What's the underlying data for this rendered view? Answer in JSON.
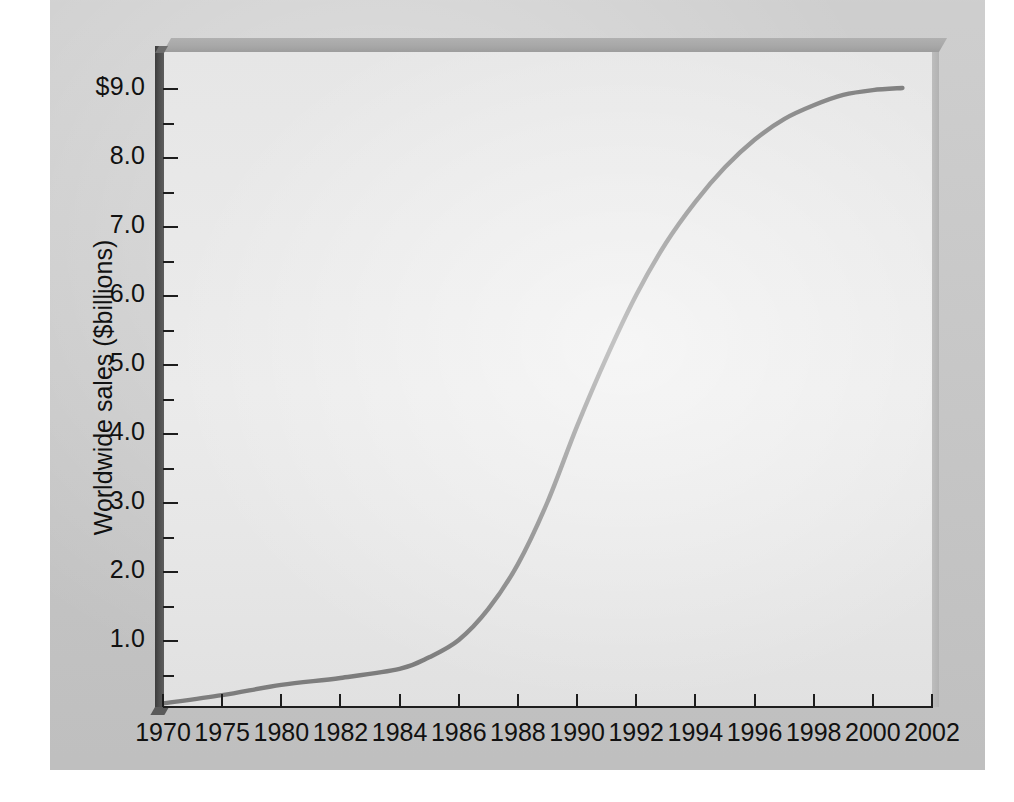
{
  "chart_data": {
    "type": "line",
    "title": "",
    "xlabel": "",
    "ylabel": "Worldwide sales ($billions)",
    "x_tick_labels": [
      "1970",
      "1975",
      "1980",
      "1982",
      "1984",
      "1986",
      "1988",
      "1990",
      "1992",
      "1994",
      "1996",
      "1998",
      "2000",
      "2002"
    ],
    "y_tick_labels": [
      "$9.0",
      "8.0",
      "7.0",
      "6.0",
      "5.0",
      "4.0",
      "3.0",
      "2.0",
      "1.0"
    ],
    "y_tick_values": [
      9.0,
      8.0,
      7.0,
      6.0,
      5.0,
      4.0,
      3.0,
      2.0,
      1.0
    ],
    "y_minor_tick_values": [
      8.5,
      7.5,
      6.5,
      5.5,
      4.5,
      3.5,
      2.5,
      1.5,
      0.5
    ],
    "ylim": [
      0.0,
      9.5
    ],
    "xlim": [
      1970,
      2002
    ],
    "grid": false,
    "legend": null,
    "series": [
      {
        "name": "Worldwide sales",
        "x": [
          1970,
          1975,
          1980,
          1982,
          1984,
          1985,
          1986,
          1987,
          1988,
          1989,
          1990,
          1991,
          1992,
          1993,
          1994,
          1995,
          1996,
          1997,
          1998,
          1999,
          2000,
          2001
        ],
        "values": [
          0.08,
          0.2,
          0.35,
          0.45,
          0.58,
          0.75,
          1.0,
          1.45,
          2.1,
          3.0,
          4.1,
          5.1,
          6.0,
          6.75,
          7.35,
          7.85,
          8.25,
          8.55,
          8.75,
          8.9,
          8.97,
          9.0
        ]
      }
    ],
    "annotations": []
  },
  "colors": {
    "board_background": "#c9c9c9",
    "plot_face": "#e8e8e8",
    "axis_wall": "#4e4e4e",
    "curve": "#7d7d7d",
    "tick": "#1d1d1d",
    "text": "#111111"
  }
}
